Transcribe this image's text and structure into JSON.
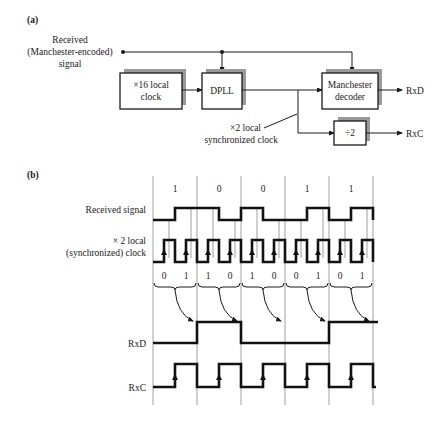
{
  "part_a": {
    "label": "(a)",
    "input_label": [
      "Received",
      "(Manchester-encoded)",
      "signal"
    ],
    "blocks": {
      "local_clock": [
        "×16 local",
        "clock"
      ],
      "dpll": "DPLL",
      "decoder": [
        "Manchester",
        "decoder"
      ],
      "divider": "÷2"
    },
    "clock_label": [
      "×2 local",
      "synchronized clock"
    ],
    "outputs": {
      "rxd": "RxD",
      "rxc": "RxC"
    }
  },
  "part_b": {
    "label": "(b)",
    "signal_labels": {
      "received": "Received signal",
      "clock": [
        "× 2 local",
        "(synchronized) clock"
      ],
      "rxd": "RxD",
      "rxc": "RxC"
    },
    "bits": [
      "1",
      "0",
      "0",
      "1",
      "1"
    ],
    "half_bits": [
      "0",
      "1",
      "1",
      "0",
      "1",
      "0",
      "0",
      "1",
      "0",
      "1"
    ],
    "rxd_levels": [
      0,
      1,
      0,
      0,
      1
    ]
  }
}
